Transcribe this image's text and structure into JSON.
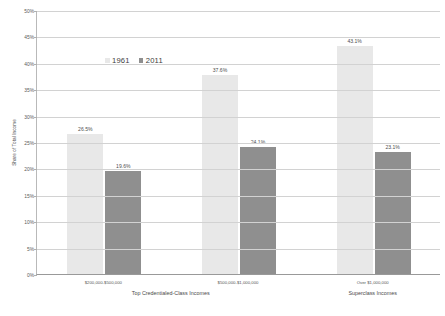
{
  "chart_data": {
    "type": "bar",
    "title": "",
    "xlabel": "",
    "ylabel": "Share of Total Income",
    "ylim": [
      0,
      50
    ],
    "yunit": "%",
    "grid": true,
    "legend_position": "inside-top-left",
    "categories": [
      "$200,000-$500,000",
      "$500,000-$1,000,000",
      "Over $1,000,000"
    ],
    "category_groups": [
      {
        "label": "Top Credentialed-Class Incomes",
        "categories": [
          "$200,000-$500,000",
          "$500,000-$1,000,000"
        ]
      },
      {
        "label": "Superclass Incomes",
        "categories": [
          "Over $1,000,000"
        ]
      }
    ],
    "series": [
      {
        "name": "1961",
        "color": "#e8e8e8",
        "values": [
          26.5,
          37.6,
          43.1
        ],
        "labels": [
          "26.5%",
          "37.6%",
          "43.1%"
        ]
      },
      {
        "name": "2011",
        "color": "#8f8f8f",
        "values": [
          19.6,
          24.1,
          23.1
        ],
        "labels": [
          "19.6%",
          "24.1%",
          "23.1%"
        ]
      }
    ],
    "y_ticks": [
      {
        "value": 0,
        "label": "0%"
      },
      {
        "value": 5,
        "label": "5%"
      },
      {
        "value": 10,
        "label": "10%"
      },
      {
        "value": 15,
        "label": "15%"
      },
      {
        "value": 20,
        "label": "20%"
      },
      {
        "value": 25,
        "label": "25%"
      },
      {
        "value": 30,
        "label": "30%"
      },
      {
        "value": 35,
        "label": "35%"
      },
      {
        "value": 40,
        "label": "40%"
      },
      {
        "value": 45,
        "label": "45%"
      },
      {
        "value": 50,
        "label": "50%"
      }
    ]
  },
  "colors": {
    "series_1961": "#e8e8e8",
    "series_2011": "#8f8f8f",
    "gridline": "#d2d2d2",
    "axis": "#999999",
    "background": "#ffffff",
    "text": "#555555"
  }
}
